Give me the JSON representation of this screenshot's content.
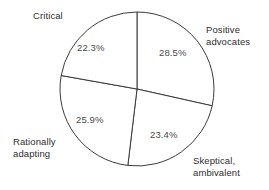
{
  "chart_data": {
    "type": "pie",
    "title": "",
    "subtitle": "",
    "xlabel": "",
    "ylabel": "",
    "legend_position": "none",
    "grid": false,
    "start_angle_deg": 0,
    "direction": "clockwise",
    "center": {
      "x": 137,
      "y": 89
    },
    "radius": 77,
    "stroke_color": "#3b3b3b",
    "fill_color": "#ffffff",
    "categories": [
      "Positive advocates",
      "Skeptical, ambivalent",
      "Rationally adapting",
      "Critical"
    ],
    "values": [
      28.5,
      23.4,
      25.9,
      22.3
    ],
    "slices": [
      {
        "name": "positive-advocates",
        "label_lines": [
          "Positive",
          "advocates"
        ],
        "value": 28.5,
        "value_label": "28.5%",
        "start_deg": 0,
        "end_deg": 102.6
      },
      {
        "name": "skeptical-ambivalent",
        "label_lines": [
          "Skeptical,",
          "ambivalent"
        ],
        "value": 23.4,
        "value_label": "23.4%",
        "start_deg": 102.6,
        "end_deg": 186.84
      },
      {
        "name": "rationally-adapting",
        "label_lines": [
          "Rationally",
          "adapting"
        ],
        "value": 25.9,
        "value_label": "25.9%",
        "start_deg": 186.84,
        "end_deg": 280.08
      },
      {
        "name": "critical",
        "label_lines": [
          "Critical"
        ],
        "value": 22.3,
        "value_label": "22.3%",
        "start_deg": 280.08,
        "end_deg": 360
      }
    ]
  },
  "labels": {
    "critical": "Critical",
    "positive_line1": "Positive",
    "positive_line2": "advocates",
    "skeptical_line1": "Skeptical,",
    "skeptical_line2": "ambivalent",
    "rational_line1": "Rationally",
    "rational_line2": "adapting"
  },
  "percentages": {
    "positive": "28.5%",
    "skeptical": "23.4%",
    "rational": "25.9%",
    "critical": "22.3%"
  }
}
